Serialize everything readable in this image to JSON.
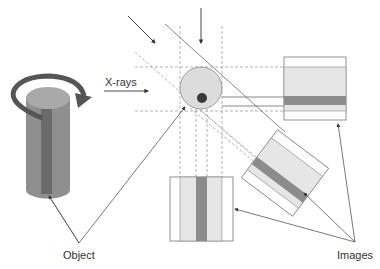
{
  "labels": {
    "xrays": "X-rays",
    "object": "Object",
    "images": "Images"
  },
  "colors": {
    "cylinder_body": "#8f8f8f",
    "cylinder_top": "#a9a9a9",
    "cylinder_core": "#6a6a6a",
    "rotation_arrow": "#555555",
    "phantom_fill": "#dcdcdc",
    "phantom_core": "#3a3a3a",
    "image_light": "#e6e6e6",
    "image_band": "#8c8c8c",
    "line": "#6a6a6a",
    "dash": "#a0a0a0"
  },
  "elements": {
    "object_3d": "rotating cylinder with central rod",
    "phantom": "circular cross-section with off-center dark core",
    "image_projections": [
      "horizontal projection (right)",
      "diagonal projection (45°)",
      "vertical projection (bottom)"
    ]
  }
}
